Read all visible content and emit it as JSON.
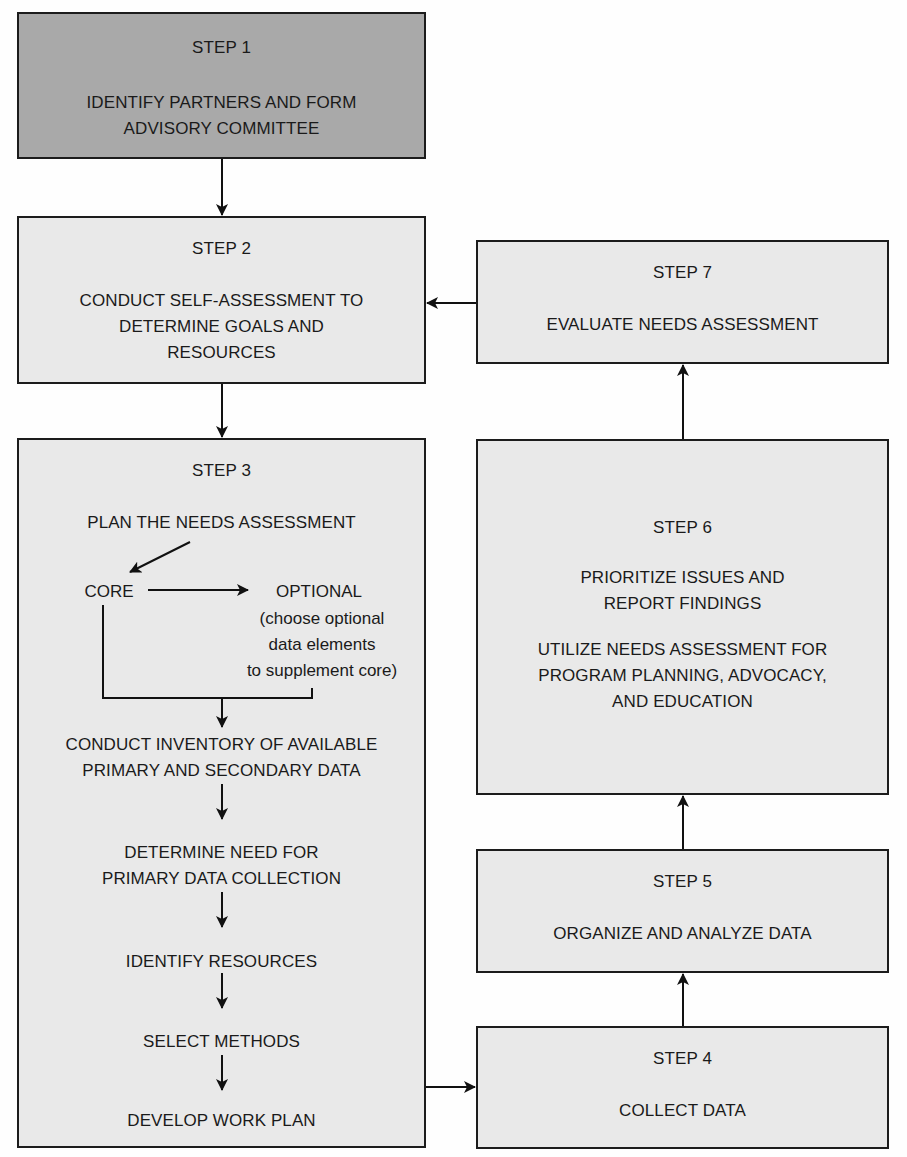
{
  "diagram": {
    "steps": [
      {
        "id": 1,
        "title": "STEP 1",
        "text": "IDENTIFY PARTNERS AND FORM\nADVISORY COMMITTEE",
        "fill": "#a9a9a9"
      },
      {
        "id": 2,
        "title": "STEP 2",
        "text": "CONDUCT SELF-ASSESSMENT TO\nDETERMINE GOALS AND\nRESOURCES",
        "fill": "#e9e9e9"
      },
      {
        "id": 3,
        "title": "STEP 3",
        "fill": "#e9e9e9",
        "plan": "PLAN THE NEEDS ASSESSMENT",
        "core": "CORE",
        "optional": "OPTIONAL",
        "optional_note": "(choose optional\ndata elements\nto supplement core)",
        "substeps": [
          "CONDUCT INVENTORY OF AVAILABLE\nPRIMARY AND SECONDARY DATA",
          "DETERMINE NEED FOR\nPRIMARY DATA COLLECTION",
          "IDENTIFY RESOURCES",
          "SELECT METHODS",
          "DEVELOP WORK PLAN"
        ]
      },
      {
        "id": 4,
        "title": "STEP 4",
        "text": "COLLECT DATA",
        "fill": "#e9e9e9"
      },
      {
        "id": 5,
        "title": "STEP 5",
        "text": "ORGANIZE AND ANALYZE DATA",
        "fill": "#e9e9e9"
      },
      {
        "id": 6,
        "title": "STEP 6",
        "text": "PRIORITIZE ISSUES AND\nREPORT FINDINGS",
        "text2": "UTILIZE NEEDS ASSESSMENT FOR\nPROGRAM PLANNING, ADVOCACY,\nAND EDUCATION",
        "fill": "#e9e9e9"
      },
      {
        "id": 7,
        "title": "STEP 7",
        "text": "EVALUATE NEEDS ASSESSMENT",
        "fill": "#e9e9e9"
      }
    ],
    "flow": [
      {
        "from": "STEP 1",
        "to": "STEP 2"
      },
      {
        "from": "STEP 2",
        "to": "STEP 3"
      },
      {
        "from": "STEP 3",
        "to": "STEP 4"
      },
      {
        "from": "STEP 4",
        "to": "STEP 5"
      },
      {
        "from": "STEP 5",
        "to": "STEP 6"
      },
      {
        "from": "STEP 6",
        "to": "STEP 7"
      },
      {
        "from": "STEP 7",
        "to": "STEP 2"
      }
    ]
  }
}
